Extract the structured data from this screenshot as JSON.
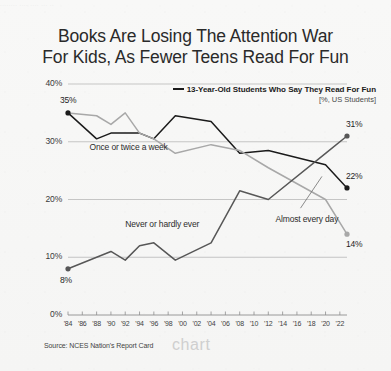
{
  "top_strip_text": "........ .... .... ... ..",
  "title": {
    "line1": "Books Are Losing The Attention War",
    "line2": "For Kids, As Fewer Teens Read For Fun"
  },
  "legend": {
    "main": "13-Year-Old Students Who Say They Read For Fun",
    "sub": "[%, US Students]"
  },
  "source": "Source: NCES Nation's Report Card",
  "watermark": "chart",
  "colors": {
    "series_once_or_twice": "#1b1b1b",
    "series_never": "#575757",
    "series_almost_every_day": "#a8a8a8",
    "gridline": "#b9b9b9",
    "axis": "#8e8e8e",
    "text": "#2a2a2a",
    "background": "#f6f6f5"
  },
  "chart_data": {
    "type": "line",
    "title": "Books Are Losing The Attention War For Kids, As Fewer Teens Read For Fun",
    "subtitle": "13-Year-Old Students Who Say They Read For Fun",
    "xlabel": "",
    "ylabel": "[%, US Students]",
    "ylim": [
      0,
      40
    ],
    "xlim": [
      1984,
      2023
    ],
    "grid": true,
    "legend_position": "inline-annotations",
    "ytick_labels": [
      "0%",
      "10%",
      "20%",
      "30%",
      "40%"
    ],
    "ytick_values": [
      0,
      10,
      20,
      30,
      40
    ],
    "xtick_labels": [
      "'84",
      "'86",
      "'88",
      "'90",
      "'92",
      "'94",
      "'96",
      "'98",
      "'00",
      "'02",
      "'04",
      "'06",
      "'08",
      "'10",
      "'12",
      "'14",
      "'16",
      "'18",
      "'20",
      "'22"
    ],
    "xtick_values": [
      1984,
      1986,
      1988,
      1990,
      1992,
      1994,
      1996,
      1998,
      2000,
      2002,
      2004,
      2006,
      2008,
      2010,
      2012,
      2014,
      2016,
      2018,
      2020,
      2022
    ],
    "x": [
      1984,
      1988,
      1990,
      1992,
      1994,
      1996,
      1999,
      2004,
      2008,
      2012,
      2020,
      2023
    ],
    "series": [
      {
        "name": "Once or twice a week",
        "color": "#1b1b1b",
        "values": [
          35,
          30.5,
          31.5,
          31.5,
          31.5,
          30.5,
          34.5,
          33.5,
          28,
          28.5,
          26,
          22
        ],
        "start_label": "35%",
        "end_label": "22%"
      },
      {
        "name": "Almost every day",
        "color": "#a8a8a8",
        "values": [
          35,
          34.5,
          33,
          35,
          31.5,
          30.5,
          28,
          29.5,
          28.5,
          25.5,
          20,
          14
        ],
        "start_label": "35%",
        "end_label": "14%"
      },
      {
        "name": "Never or hardly ever",
        "color": "#575757",
        "values": [
          8,
          10,
          11,
          9.5,
          12,
          12.5,
          9.5,
          12.5,
          21.5,
          20,
          28,
          31
        ],
        "start_label": "8%",
        "end_label": "31%"
      }
    ],
    "annotations": [
      {
        "text": "Once or twice a week",
        "x": 1987,
        "y": 29
      },
      {
        "text": "Never or hardly ever",
        "x": 1992,
        "y": 15.5
      },
      {
        "text": "Almost every day",
        "x": 2013,
        "y": 16.5
      }
    ],
    "point_labels": [
      {
        "text": "35%",
        "series": "Once or twice a week",
        "position": "start"
      },
      {
        "text": "8%",
        "series": "Never or hardly ever",
        "position": "start"
      },
      {
        "text": "31%",
        "series": "Never or hardly ever",
        "position": "end"
      },
      {
        "text": "22%",
        "series": "Once or twice a week",
        "position": "end"
      },
      {
        "text": "14%",
        "series": "Almost every day",
        "position": "end"
      }
    ]
  }
}
